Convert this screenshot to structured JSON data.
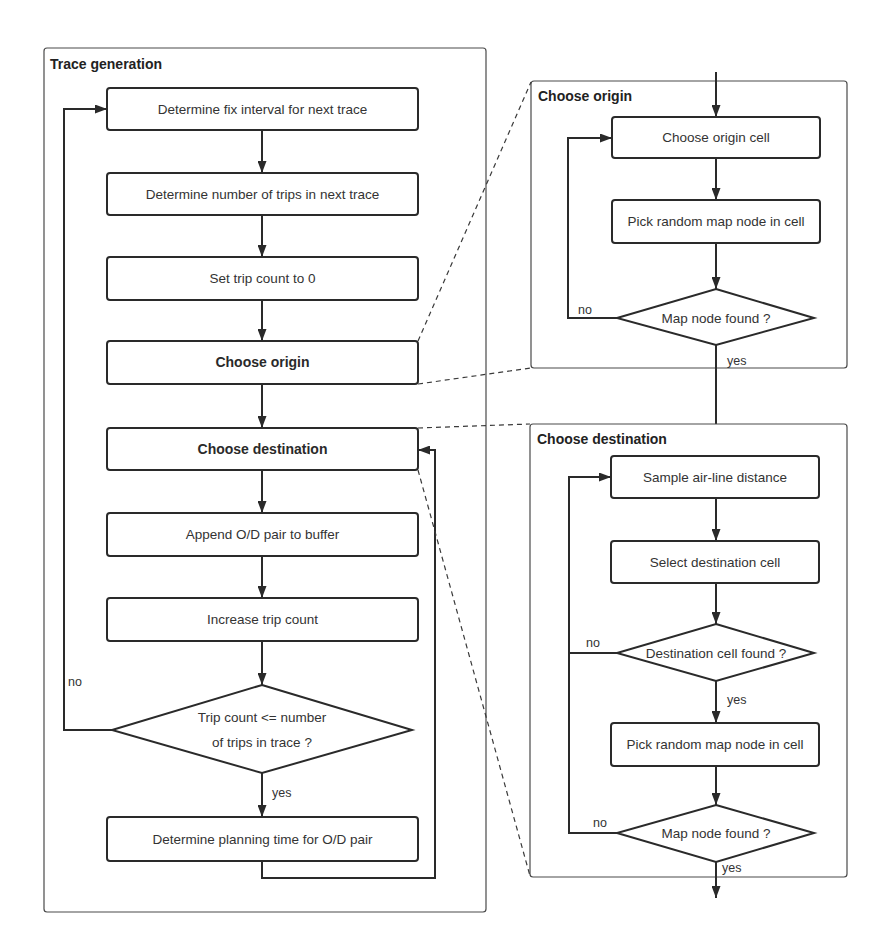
{
  "colors": {
    "background": "#ffffff",
    "line": "#2a2a2a",
    "panel_border": "#4a4a4a",
    "text": "#333333"
  },
  "trace_generation": {
    "title": "Trace generation",
    "steps": [
      "Determine fix interval for next trace",
      "Determine number of trips in next trace",
      "Set trip count to 0",
      "Choose origin",
      "Choose destination",
      "Append O/D pair to buffer",
      "Increase trip count"
    ],
    "decision": {
      "line1": "Trip count <= number",
      "line2": "of trips in trace ?",
      "no_label": "no",
      "yes_label": "yes"
    },
    "final_step": "Determine planning time for O/D pair"
  },
  "choose_origin": {
    "title": "Choose origin",
    "steps": [
      "Choose origin cell",
      "Pick random map node in cell"
    ],
    "decision": {
      "text": "Map node found ?",
      "no_label": "no",
      "yes_label": "yes"
    }
  },
  "choose_destination": {
    "title": "Choose destination",
    "steps": [
      "Sample air-line distance",
      "Select destination cell"
    ],
    "decision_cell": {
      "text": "Destination cell found ?",
      "no_label": "no",
      "yes_label": "yes"
    },
    "step_after_cell": "Pick random map node in cell",
    "decision_node": {
      "text": "Map node found ?",
      "no_label": "no",
      "yes_label": "yes"
    }
  }
}
